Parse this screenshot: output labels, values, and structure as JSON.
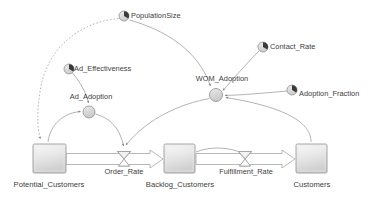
{
  "diagram": {
    "type": "system-dynamics-stock-flow",
    "background_color": "#ffffff",
    "text_color": "#3d3d3d",
    "line_color": "#8c8c8c",
    "stock_fill_top": "#f4f4f4",
    "stock_fill_bottom": "#d4d4d4",
    "stock_border": "#9a9a9a",
    "converter_fill": "#dedede",
    "converter_border": "#8f8f8f"
  },
  "stocks": [
    {
      "id": "potential_customers",
      "label": "Potential_Customers",
      "x": 33,
      "y": 144,
      "w": 33,
      "h": 29,
      "label_x": 49,
      "label_y": 178
    },
    {
      "id": "backlog_customers",
      "label": "Backlog_Customers",
      "x": 164,
      "y": 144,
      "w": 31,
      "h": 29,
      "label_x": 180,
      "label_y": 178
    },
    {
      "id": "customers",
      "label": "Customers",
      "x": 296,
      "y": 144,
      "w": 31,
      "h": 29,
      "label_x": 312,
      "label_y": 178
    }
  ],
  "flows": [
    {
      "id": "order_rate",
      "label": "Order_Rate",
      "valve_x": 124,
      "valve_y": 159,
      "label_x": 124,
      "label_y": 169,
      "from": "potential_customers",
      "to": "backlog_customers"
    },
    {
      "id": "fulfillment_rate",
      "label": "Fulfillment_Rate",
      "valve_x": 245,
      "valve_y": 159,
      "label_x": 245,
      "label_y": 169,
      "from": "backlog_customers",
      "to": "customers"
    }
  ],
  "converters": [
    {
      "id": "population_size",
      "label": "PopulationSize",
      "cx": 124,
      "cy": 16,
      "r": 5,
      "label_x": 131,
      "label_y": 12
    },
    {
      "id": "ad_effectiveness",
      "label": "Ad_Effectiveness",
      "cx": 69,
      "cy": 69,
      "r": 5,
      "label_x": 75,
      "label_y": 65
    },
    {
      "id": "contact_rate",
      "label": "Contact_Rate",
      "cx": 263,
      "cy": 47,
      "r": 5,
      "label_x": 270,
      "label_y": 43
    },
    {
      "id": "adoption_fraction",
      "label": "Adoption_Fraction",
      "cx": 292,
      "cy": 90,
      "r": 5,
      "label_x": 299,
      "label_y": 90
    }
  ],
  "auxiliaries": [
    {
      "id": "ad_adoption",
      "label": "Ad_Adoption",
      "cx": 89,
      "cy": 112,
      "r": 6,
      "label_x": 89,
      "label_y": 96
    },
    {
      "id": "wom_adoption",
      "label": "WOM_Adoption",
      "cx": 216,
      "cy": 95,
      "r": 6.5,
      "label_x": 216,
      "label_y": 80
    }
  ],
  "links": [
    {
      "id": "link-populationsize-to-potential",
      "from": "population_size",
      "to": "potential_customers",
      "style": "dotted"
    },
    {
      "id": "link-populationsize-to-wom",
      "from": "population_size",
      "to": "wom_adoption",
      "style": "solid"
    },
    {
      "id": "link-ad-effectiveness-to-ad-adoption",
      "from": "ad_effectiveness",
      "to": "ad_adoption",
      "style": "solid"
    },
    {
      "id": "link-potential-to-ad-adoption",
      "from": "potential_customers",
      "to": "ad_adoption",
      "style": "solid"
    },
    {
      "id": "link-ad-adoption-to-order-rate",
      "from": "ad_adoption",
      "to": "order_rate",
      "style": "solid"
    },
    {
      "id": "link-contact-rate-to-wom",
      "from": "contact_rate",
      "to": "wom_adoption",
      "style": "solid"
    },
    {
      "id": "link-adoption-fraction-to-wom",
      "from": "adoption_fraction",
      "to": "wom_adoption",
      "style": "solid"
    },
    {
      "id": "link-customers-to-wom",
      "from": "customers",
      "to": "wom_adoption",
      "style": "solid"
    },
    {
      "id": "link-wom-to-order-rate",
      "from": "wom_adoption",
      "to": "order_rate",
      "style": "solid"
    },
    {
      "id": "link-backlog-to-fulfillment-rate",
      "from": "backlog_customers",
      "to": "fulfillment_rate",
      "style": "solid"
    }
  ]
}
